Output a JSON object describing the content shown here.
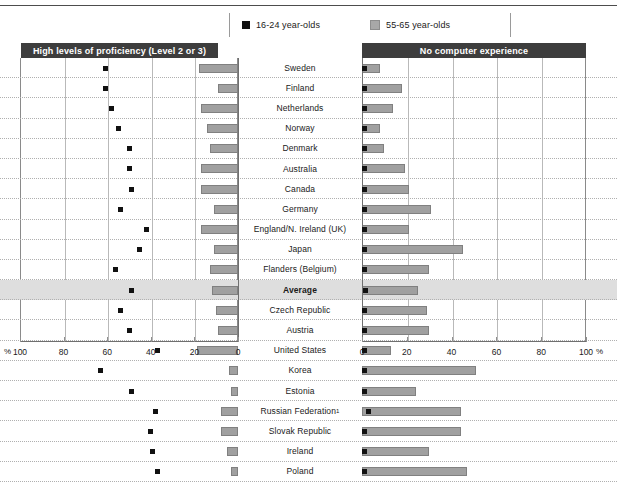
{
  "legend": {
    "items": [
      {
        "label": "16-24 year-olds",
        "color": "#111111",
        "key": "young"
      },
      {
        "label": "55-65 year-olds",
        "color": "#a8a8a8",
        "key": "old"
      }
    ]
  },
  "panels": {
    "left_title": "High levels of proficiency (Level 2 or 3)",
    "right_title": "No computer experience"
  },
  "axis": {
    "left_ticks": [
      "100",
      "80",
      "60",
      "40",
      "20",
      "0"
    ],
    "right_ticks": [
      "0",
      "20",
      "40",
      "60",
      "80",
      "100"
    ],
    "unit_left": "%",
    "unit_right": "%",
    "min": 0,
    "max": 100
  },
  "chart_data": {
    "type": "bar",
    "xlabel": "%",
    "ylabel": "",
    "xlim": [
      0,
      100
    ],
    "grid": true,
    "legend_position": "top",
    "categories": [
      "Sweden",
      "Finland",
      "Netherlands",
      "Norway",
      "Denmark",
      "Australia",
      "Canada",
      "Germany",
      "England/N. Ireland (UK)",
      "Japan",
      "Flanders (Belgium)",
      "Average",
      "Czech Republic",
      "Austria",
      "United States",
      "Korea",
      "Estonia",
      "Russian Federation¹",
      "Slovak Republic",
      "Ireland",
      "Poland"
    ],
    "panels": [
      {
        "name": "High levels of proficiency (Level 2 or 3)",
        "direction": "right-to-left",
        "series": [
          {
            "name": "16-24 year-olds",
            "marker": "square",
            "color": "#111111",
            "values": [
              61,
              61,
              58,
              55,
              50,
              50,
              49,
              54,
              42,
              45,
              56,
              49,
              54,
              50,
              37,
              63,
              49,
              38,
              40,
              39,
              37
            ]
          },
          {
            "name": "55-65 year-olds",
            "marker": "bar",
            "color": "#a0a0a0",
            "values": [
              18,
              9,
              17,
              14,
              13,
              17,
              17,
              11,
              17,
              11,
              13,
              12,
              10,
              9,
              19,
              4,
              3,
              8,
              8,
              5,
              3
            ]
          }
        ]
      },
      {
        "name": "No computer experience",
        "direction": "left-to-right",
        "series": [
          {
            "name": "16-24 year-olds",
            "marker": "square",
            "color": "#111111",
            "values": [
              0.3,
              0.3,
              0.3,
              0.3,
              0.3,
              0.4,
              0.4,
              0.5,
              0.5,
              0.4,
              0.4,
              0.7,
              0.5,
              0.5,
              0.6,
              0.3,
              0.4,
              2.4,
              0.5,
              0.4,
              0.4
            ]
          },
          {
            "name": "55-65 year-olds",
            "marker": "bar",
            "color": "#a0a0a0",
            "values": [
              8,
              18,
              14,
              8,
              10,
              19,
              21,
              31,
              21,
              45,
              30,
              25,
              29,
              30,
              13,
              51,
              24,
              44,
              44,
              30,
              47
            ]
          }
        ]
      }
    ]
  }
}
